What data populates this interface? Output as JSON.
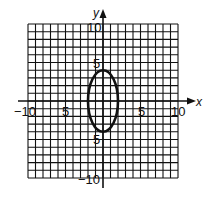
{
  "chart_data": {
    "type": "line",
    "title": "",
    "equation": "x^2/4 + y^2/16 = 1",
    "xlabel": "x",
    "ylabel": "y",
    "xlim": [
      -10,
      10
    ],
    "ylim": [
      -10,
      10
    ],
    "grid": true,
    "x_tick_labels": [
      "-10",
      "5",
      "5",
      "10"
    ],
    "y_tick_labels": [
      "10",
      "5",
      "5",
      "-10"
    ],
    "series": [
      {
        "name": "ellipse",
        "center": [
          0,
          0
        ],
        "semi_axis_x": 2,
        "semi_axis_y": 4,
        "points": [
          [
            0,
            4
          ],
          [
            2,
            0
          ],
          [
            0,
            -4
          ],
          [
            -2,
            0
          ]
        ]
      }
    ]
  },
  "labels": {
    "x_axis": "x",
    "y_axis": "y",
    "x_neg10": "−10",
    "x_neg5": "5",
    "x_pos5": "5",
    "x_pos10": "10",
    "y_pos10": "10",
    "y_pos5": "5",
    "y_neg5": "5",
    "y_neg10": "−10"
  },
  "colors": {
    "grid": "#111111",
    "curve": "#111111",
    "background": "#ffffff"
  }
}
